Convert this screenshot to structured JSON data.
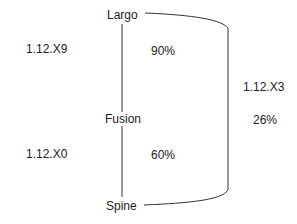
{
  "diagram": {
    "nodes": [
      {
        "id": "largo",
        "label": "Largo"
      },
      {
        "id": "fusion",
        "label": "Fusion"
      },
      {
        "id": "spine",
        "label": "Spine"
      }
    ],
    "left_labels": [
      {
        "id": "top_left",
        "text": "1.12.X9"
      },
      {
        "id": "bottom_left",
        "text": "1.12.X0"
      }
    ],
    "inner_labels": [
      {
        "id": "upper_pct",
        "text": "90%"
      },
      {
        "id": "lower_pct",
        "text": "60%"
      }
    ],
    "right_labels": [
      {
        "id": "right_version",
        "text": "1.12.X3"
      },
      {
        "id": "right_pct",
        "text": "26%"
      }
    ],
    "edges": [
      {
        "from": "largo",
        "to": "fusion",
        "type": "vertical"
      },
      {
        "from": "fusion",
        "to": "spine",
        "type": "vertical"
      },
      {
        "from": "largo",
        "to": "spine",
        "type": "curved-right"
      }
    ],
    "line_color": "#333333"
  }
}
